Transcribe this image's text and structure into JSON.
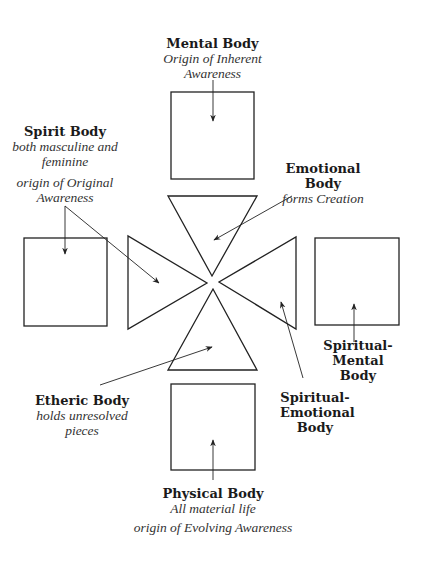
{
  "mental": {
    "title": "Mental Body",
    "sub1": "Origin of Inherent",
    "sub2": "Awareness"
  },
  "spirit": {
    "title": "Spirit Body",
    "sub1": "both masculine and",
    "sub2": "feminine",
    "sub3": "origin of Original",
    "sub4": "Awareness"
  },
  "emotional": {
    "title": "Emotional Body",
    "sub1": "forms Creation"
  },
  "spiritual_mental": {
    "title1": "Spiritual-",
    "title2": "Mental Body"
  },
  "etheric": {
    "title": "Etheric Body",
    "sub1": "holds unresolved",
    "sub2": "pieces"
  },
  "spiritual_emotional": {
    "title1": "Spiritual-",
    "title2": "Emotional",
    "title3": "Body"
  },
  "physical": {
    "title": "Physical Body",
    "sub1": "All material life",
    "sub2": "origin of Evolving Awareness"
  },
  "colors": {
    "stroke": "#222222",
    "background": "#ffffff"
  }
}
